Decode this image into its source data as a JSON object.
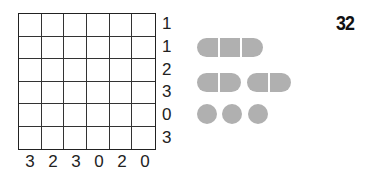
{
  "puzzle_number": "32",
  "grid": {
    "rows": 6,
    "cols": 6
  },
  "row_clues": [
    "1",
    "1",
    "2",
    "3",
    "0",
    "3"
  ],
  "col_clues": [
    "3",
    "2",
    "3",
    "0",
    "2",
    "0"
  ],
  "fleet": [
    {
      "name": "cruiser",
      "length": 3,
      "count": 1
    },
    {
      "name": "destroyer",
      "length": 2,
      "count": 2
    },
    {
      "name": "submarine",
      "length": 1,
      "count": 3
    }
  ],
  "colors": {
    "ship": "#b0b0b0",
    "grid": "#222222"
  }
}
